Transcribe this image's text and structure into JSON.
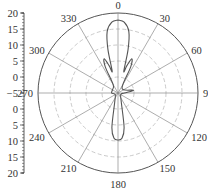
{
  "chart_data": {
    "type": "polar",
    "title": "",
    "angular_axis": {
      "direction": "clockwise",
      "zero_at": "top",
      "tick_labels": [
        "0",
        "30",
        "60",
        "90",
        "120",
        "150",
        "180",
        "210",
        "240",
        "270",
        "300",
        "330"
      ],
      "unit": "degrees"
    },
    "radial_axis": {
      "range": [
        -5,
        20
      ],
      "tick_labels_upper": [
        "20",
        "15",
        "10",
        "5",
        "0",
        "-5"
      ],
      "tick_labels_lower": [
        "0",
        "5",
        "10",
        "15",
        "20"
      ],
      "ring_values": [
        0,
        5,
        10,
        15,
        20
      ],
      "grid": "dashed"
    },
    "series": [
      {
        "name": "radiation pattern",
        "color": "#555555",
        "points": [
          {
            "angle": 0,
            "value": 17.8
          },
          {
            "angle": 5,
            "value": 17.2
          },
          {
            "angle": 10,
            "value": 14.5
          },
          {
            "angle": 13,
            "value": 9
          },
          {
            "angle": 15,
            "value": 2
          },
          {
            "angle": 18,
            "value": 4
          },
          {
            "angle": 22,
            "value": 6.5
          },
          {
            "angle": 26,
            "value": 4
          },
          {
            "angle": 30,
            "value": -2
          },
          {
            "angle": 60,
            "value": -3
          },
          {
            "angle": 80,
            "value": 0
          },
          {
            "angle": 90,
            "value": -3
          },
          {
            "angle": 120,
            "value": -4
          },
          {
            "angle": 160,
            "value": -2
          },
          {
            "angle": 170,
            "value": 6
          },
          {
            "angle": 175,
            "value": 9.2
          },
          {
            "angle": 180,
            "value": 9.7
          },
          {
            "angle": 185,
            "value": 9.2
          },
          {
            "angle": 190,
            "value": 6
          },
          {
            "angle": 200,
            "value": -2
          },
          {
            "angle": 240,
            "value": -4
          },
          {
            "angle": 270,
            "value": -3
          },
          {
            "angle": 300,
            "value": -3
          },
          {
            "angle": 330,
            "value": -2
          },
          {
            "angle": 334,
            "value": 4
          },
          {
            "angle": 338,
            "value": 6.5
          },
          {
            "angle": 342,
            "value": 4
          },
          {
            "angle": 345,
            "value": 2
          },
          {
            "angle": 347,
            "value": 9
          },
          {
            "angle": 350,
            "value": 14.5
          },
          {
            "angle": 355,
            "value": 17.2
          },
          {
            "angle": 360,
            "value": 17.8
          }
        ]
      }
    ],
    "legend": null,
    "grid": true
  },
  "colors": {
    "outer_circle": "#555555",
    "grid": "#bdbdbd",
    "spokes": "#8a8a8a",
    "trace": "#5a5a5a",
    "text": "#333333"
  }
}
